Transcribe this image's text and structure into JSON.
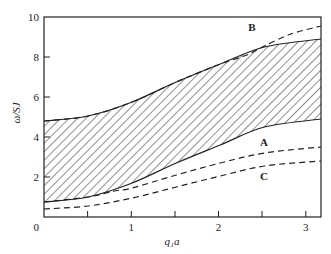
{
  "chart_data": {
    "type": "line",
    "title": "",
    "xlabel": "q₁a",
    "ylabel": "ω/SJ",
    "xlim": [
      0,
      3.1416
    ],
    "ylim": [
      0,
      10
    ],
    "grid": false,
    "x_ticks": [
      0,
      1,
      2,
      3
    ],
    "x_minor_ticks": [
      0.5,
      1.5,
      2.5
    ],
    "y_ticks": [
      0,
      2,
      4,
      6,
      8,
      10
    ],
    "shaded_region": {
      "description": "hatched band between lower and upper solid curves",
      "x": [
        0,
        0.5,
        1.0,
        1.5,
        2.0,
        2.5,
        3.1416
      ],
      "lower": [
        0.75,
        1.0,
        1.7,
        2.7,
        3.6,
        4.5,
        4.9
      ],
      "upper": [
        4.8,
        5.05,
        5.75,
        6.75,
        7.65,
        8.5,
        8.9
      ]
    },
    "series": [
      {
        "name": "B",
        "style": "dashed",
        "x": [
          0,
          0.5,
          1.0,
          1.5,
          2.0,
          2.3,
          2.5,
          2.8,
          3.1416
        ],
        "values": [
          4.8,
          5.05,
          5.75,
          6.75,
          7.65,
          8.1,
          8.55,
          9.15,
          9.55
        ]
      },
      {
        "name": "A",
        "style": "dashed",
        "x": [
          0,
          0.5,
          0.8,
          1.0,
          1.5,
          2.0,
          2.5,
          3.1416
        ],
        "values": [
          0.75,
          1.0,
          1.3,
          1.45,
          2.1,
          2.7,
          3.2,
          3.5
        ]
      },
      {
        "name": "C",
        "style": "dashed",
        "x": [
          0,
          0.5,
          1.0,
          1.5,
          2.0,
          2.5,
          3.1416
        ],
        "values": [
          0.4,
          0.55,
          0.95,
          1.5,
          2.05,
          2.55,
          2.8
        ]
      }
    ],
    "annotations": [
      {
        "text": "B",
        "x": 2.4,
        "y": 9.4
      },
      {
        "text": "A",
        "x": 2.53,
        "y": 3.7
      },
      {
        "text": "C",
        "x": 2.53,
        "y": 1.7
      }
    ]
  },
  "labels": {
    "x_axis": "q₁a",
    "y_axis": "ω/SJ",
    "x_ticks": [
      "0",
      "1",
      "2",
      "3"
    ],
    "y_ticks": [
      "2",
      "4",
      "6",
      "8",
      "10"
    ],
    "curve_b": "B",
    "curve_a": "A",
    "curve_c": "C"
  }
}
